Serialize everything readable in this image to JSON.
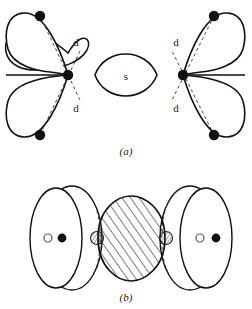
{
  "figure": {
    "panels": [
      {
        "id": "a",
        "caption": "(a)",
        "description": "two-dimensional cross section of bonding orbitals",
        "orbital_labels": [
          {
            "name": "d",
            "text": "d",
            "x": 76,
            "y": 42
          },
          {
            "name": "d",
            "text": "d",
            "x": 76,
            "y": 108
          },
          {
            "name": "s",
            "text": "s",
            "x": 126,
            "y": 76
          },
          {
            "name": "d",
            "text": "d",
            "x": 176,
            "y": 42
          },
          {
            "name": "d",
            "text": "d",
            "x": 176,
            "y": 108
          }
        ],
        "nuclei": [
          {
            "type": "central-node",
            "x": 68,
            "y": 75
          },
          {
            "type": "central-node",
            "x": 183,
            "y": 75
          }
        ],
        "axis_endpoints": [
          {
            "type": "filled-dot",
            "x": 40,
            "y": 16
          },
          {
            "type": "filled-dot",
            "x": 40,
            "y": 135
          },
          {
            "type": "filled-dot",
            "x": 214,
            "y": 16
          },
          {
            "type": "filled-dot",
            "x": 214,
            "y": 135
          }
        ]
      },
      {
        "id": "b",
        "caption": "(b)",
        "description": "three-dimensional perspective view with hatched overlap region",
        "markers": [
          {
            "type": "open-circle",
            "x": 48,
            "y": 238
          },
          {
            "type": "filled-dot",
            "x": 62,
            "y": 238
          },
          {
            "type": "stippled-circle",
            "x": 97,
            "y": 238
          },
          {
            "type": "stippled-circle",
            "x": 166,
            "y": 238
          },
          {
            "type": "open-circle",
            "x": 200,
            "y": 238
          },
          {
            "type": "filled-dot",
            "x": 216,
            "y": 238
          }
        ]
      }
    ],
    "colors": {
      "stroke": "#111111",
      "fill": "#ffffff",
      "hatch": "#111111",
      "background": "#ffffff"
    }
  }
}
